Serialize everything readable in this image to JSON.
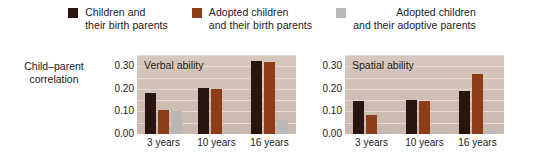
{
  "legend": {
    "items": [
      {
        "label": "Children and\ntheir birth parents",
        "color": "#2a1410",
        "swatch_name": "legend-swatch-birth"
      },
      {
        "label": "Adopted children\nand their birth parents",
        "color": "#8d3c18",
        "swatch_name": "legend-swatch-adopted-birth"
      },
      {
        "label": "Adopted children\nand their adoptive parents",
        "color": "#b8b8b8",
        "swatch_name": "legend-swatch-adoptive"
      }
    ]
  },
  "axis_caption": "Child–parent\ncorrelation",
  "chart_data": {
    "type": "bar",
    "title": "",
    "ylabel": "Child–parent correlation",
    "xlabel": "",
    "ylim": [
      0.0,
      0.35
    ],
    "yticks": [
      "0.00",
      "0.10",
      "0.20",
      "0.30"
    ],
    "ytick_values": [
      0.0,
      0.1,
      0.2,
      0.3
    ],
    "grid": true,
    "legend_position": "top",
    "categories": [
      "3 years",
      "10 years",
      "16 years"
    ],
    "panels": [
      {
        "title": "Verbal ability",
        "series": [
          {
            "name": "Children and their birth parents",
            "color": "#2a1410",
            "values": [
              0.18,
              0.205,
              0.325
            ]
          },
          {
            "name": "Adopted children and their birth parents",
            "color": "#8d3c18",
            "values": [
              0.105,
              0.2,
              0.32
            ]
          },
          {
            "name": "Adopted children and their adoptive parents",
            "color": "#b8b8b8",
            "values": [
              0.1,
              0.01,
              0.06
            ]
          }
        ]
      },
      {
        "title": "Spatial ability",
        "series": [
          {
            "name": "Children and their birth parents",
            "color": "#2a1410",
            "values": [
              0.145,
              0.15,
              0.19
            ]
          },
          {
            "name": "Adopted children and their birth parents",
            "color": "#8d3c18",
            "values": [
              0.085,
              0.145,
              0.265
            ]
          },
          {
            "name": "Adopted children and their adoptive parents",
            "color": "#b8b8b8",
            "values": [
              0.01,
              0.01,
              0.015
            ]
          }
        ]
      }
    ]
  }
}
